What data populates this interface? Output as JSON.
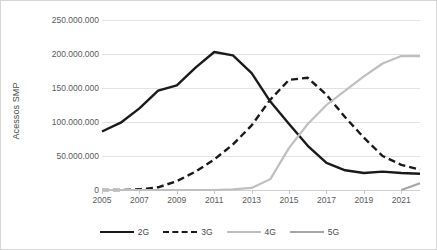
{
  "chart_data": {
    "type": "line",
    "title": "",
    "xlabel": "",
    "ylabel": "Acessos SMP",
    "xlim": [
      2005,
      2022
    ],
    "ylim": [
      0,
      250000000
    ],
    "grid": true,
    "legend_position": "bottom",
    "x": [
      2005,
      2006,
      2007,
      2008,
      2009,
      2010,
      2011,
      2012,
      2013,
      2014,
      2015,
      2016,
      2017,
      2018,
      2019,
      2020,
      2021,
      2022
    ],
    "y_ticks": [
      0,
      50000000,
      100000000,
      150000000,
      200000000,
      250000000
    ],
    "y_tick_labels": [
      "0",
      "50.000.000",
      "100.000.000",
      "150.000.000",
      "200.000.000",
      "250.000.000"
    ],
    "x_ticks": [
      2005,
      2007,
      2009,
      2011,
      2013,
      2015,
      2017,
      2019,
      2021
    ],
    "x_tick_labels": [
      "2005",
      "2007",
      "2009",
      "2011",
      "2013",
      "2015",
      "2017",
      "2019",
      "2021"
    ],
    "series": [
      {
        "name": "2G",
        "color": "#1a1a1a",
        "style": "solid",
        "values": [
          86000000,
          99000000,
          120000000,
          146000000,
          154000000,
          180000000,
          203000000,
          198000000,
          172000000,
          130000000,
          97000000,
          65000000,
          40000000,
          29000000,
          25000000,
          27000000,
          25000000,
          24000000
        ]
      },
      {
        "name": "3G",
        "color": "#1a1a1a",
        "style": "dashed",
        "values": [
          0,
          0,
          1000000,
          4000000,
          13000000,
          27000000,
          45000000,
          67000000,
          95000000,
          133000000,
          162000000,
          165000000,
          140000000,
          107000000,
          77000000,
          50000000,
          37000000,
          30000000
        ]
      },
      {
        "name": "4G",
        "color": "#bfbfbf",
        "style": "solid",
        "values": [
          0,
          0,
          0,
          0,
          0,
          0,
          0,
          1000000,
          3000000,
          16000000,
          62000000,
          97000000,
          125000000,
          146000000,
          167000000,
          186000000,
          197000000,
          197000000
        ]
      },
      {
        "name": "5G",
        "color": "#a6a6a6",
        "style": "solid",
        "values": [
          null,
          null,
          null,
          null,
          null,
          null,
          null,
          null,
          null,
          null,
          null,
          null,
          null,
          null,
          null,
          null,
          0,
          10000000
        ]
      }
    ]
  },
  "legend": {
    "items": [
      {
        "label": "2G"
      },
      {
        "label": "3G"
      },
      {
        "label": "4G"
      },
      {
        "label": "5G"
      }
    ]
  }
}
